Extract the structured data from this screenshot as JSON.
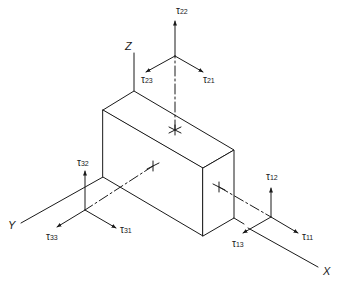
{
  "diagram": {
    "type": "stress-element-isometric",
    "stroke_color": "#1a1a1a",
    "background": "#ffffff",
    "axes": [
      {
        "name": "Z",
        "label": "Z"
      },
      {
        "name": "Y",
        "label": "Y"
      },
      {
        "name": "X",
        "label": "X"
      }
    ],
    "stress_groups": [
      {
        "face": "top (normal Z-direction, index 2)",
        "components": [
          {
            "symbol": "τ",
            "sub": "22",
            "label": "τ22"
          },
          {
            "symbol": "τ",
            "sub": "23",
            "label": "τ23"
          },
          {
            "symbol": "τ",
            "sub": "21",
            "label": "τ21"
          }
        ]
      },
      {
        "face": "left (normal Y-direction, index 3)",
        "components": [
          {
            "symbol": "τ",
            "sub": "32",
            "label": "τ32"
          },
          {
            "symbol": "τ",
            "sub": "33",
            "label": "τ33"
          },
          {
            "symbol": "τ",
            "sub": "31",
            "label": "τ31"
          }
        ]
      },
      {
        "face": "right (normal X-direction, index 1)",
        "components": [
          {
            "symbol": "τ",
            "sub": "12",
            "label": "τ12"
          },
          {
            "symbol": "τ",
            "sub": "13",
            "label": "τ13"
          },
          {
            "symbol": "τ",
            "sub": "11",
            "label": "τ11"
          }
        ]
      }
    ]
  }
}
